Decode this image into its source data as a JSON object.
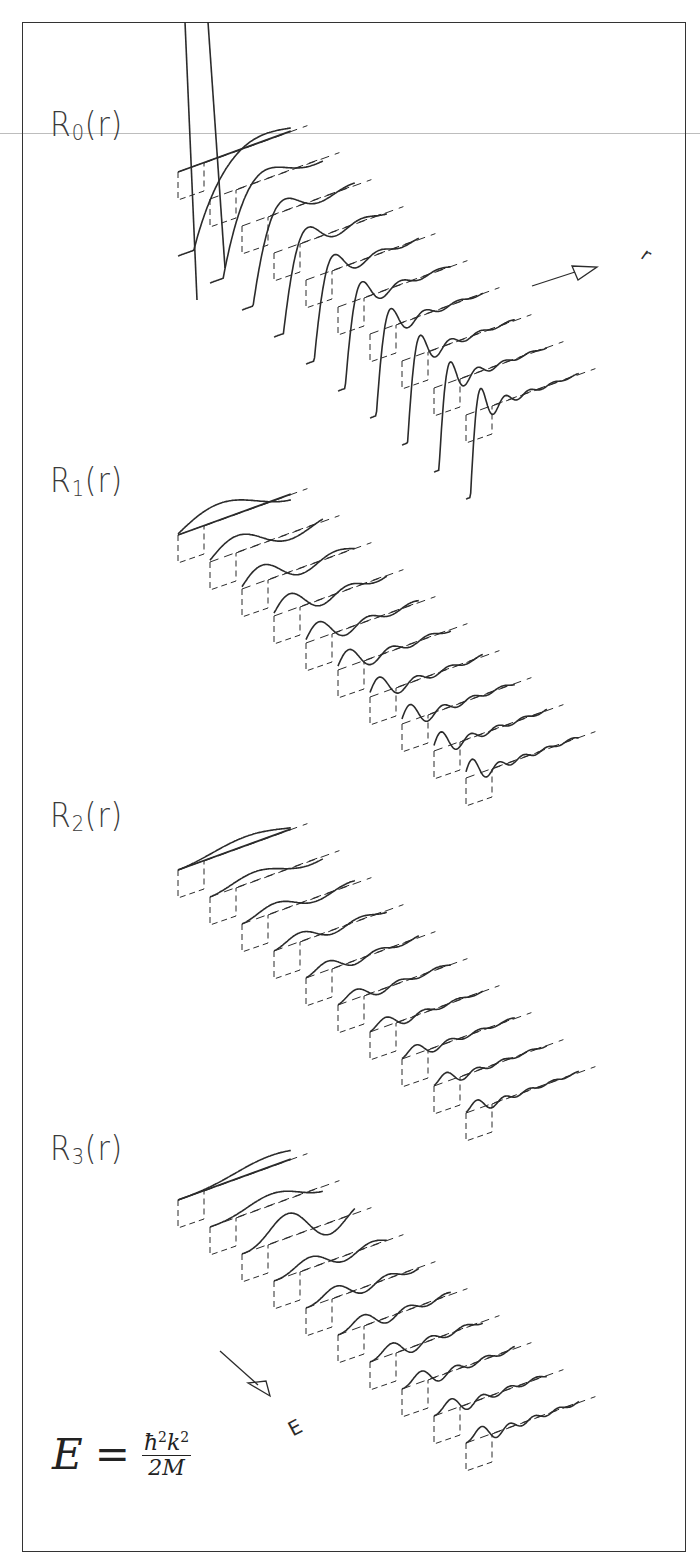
{
  "figure": {
    "panels": [
      {
        "label_main": "R",
        "label_sub": "0",
        "label_tail": "(r)"
      },
      {
        "label_main": "R",
        "label_sub": "1",
        "label_tail": "(r)"
      },
      {
        "label_main": "R",
        "label_sub": "2",
        "label_tail": "(r)"
      },
      {
        "label_main": "R",
        "label_sub": "3",
        "label_tail": "(r)"
      }
    ],
    "axis_labels": {
      "r_axis": "r",
      "energy_axis": "E"
    },
    "equation": {
      "lhs": "E",
      "equals": "=",
      "numerator_h": "ħ",
      "numerator_h_exp": "2",
      "numerator_k": "k",
      "numerator_k_exp": "2",
      "denominator": "2M"
    },
    "colors": {
      "line": "#2b2b2b",
      "frame": "#333333",
      "scanline": "#bdbdbd",
      "background": "#ffffff"
    }
  },
  "chart_data": [
    {
      "type": "line",
      "title": "R0(r)",
      "layout": "3D waterfall, 10 energy slices offset diagonally",
      "xlabel": "r",
      "zlabel": "E",
      "series_count": 10,
      "angular_momentum_l": 0,
      "origin": [
        178,
        172
      ],
      "slice_offset": [
        32,
        27
      ],
      "r_axis_length": 120,
      "amplitude": 150,
      "k_values": [
        0.6,
        0.9,
        1.2,
        1.5,
        1.8,
        2.1,
        2.4,
        2.7,
        3.0,
        3.3
      ],
      "notes": "Strong downward spike near small r, decaying oscillations with r"
    },
    {
      "type": "line",
      "title": "R1(r)",
      "layout": "3D waterfall, 10 energy slices offset diagonally",
      "xlabel": "r",
      "zlabel": "E",
      "series_count": 10,
      "angular_momentum_l": 1,
      "origin": [
        178,
        535
      ],
      "slice_offset": [
        32,
        27
      ],
      "r_axis_length": 120,
      "amplitude": 60,
      "k_values": [
        0.6,
        0.9,
        1.2,
        1.5,
        1.8,
        2.1,
        2.4,
        2.7,
        3.0,
        3.3
      ],
      "notes": "Sharp peak near small r followed by decaying oscillations"
    },
    {
      "type": "line",
      "title": "R2(r)",
      "layout": "3D waterfall, 10 energy slices offset diagonally",
      "xlabel": "r",
      "zlabel": "E",
      "series_count": 10,
      "angular_momentum_l": 2,
      "origin": [
        178,
        870
      ],
      "slice_offset": [
        32,
        27
      ],
      "r_axis_length": 120,
      "amplitude": 32,
      "k_values": [
        0.6,
        0.9,
        1.2,
        1.5,
        1.8,
        2.1,
        2.4,
        2.7,
        3.0,
        3.3
      ],
      "notes": "Smooth first peak, gently decaying oscillations"
    },
    {
      "type": "line",
      "title": "R3(r)",
      "layout": "3D waterfall, 10 energy slices offset diagonally",
      "xlabel": "r",
      "zlabel": "E",
      "series_count": 10,
      "angular_momentum_l": 3,
      "origin": [
        178,
        1200
      ],
      "slice_offset": [
        32,
        27
      ],
      "r_axis_length": 120,
      "amplitude": 40,
      "k_values": [
        0.6,
        0.9,
        1.2,
        1.5,
        1.8,
        2.1,
        2.4,
        2.7,
        3.0,
        3.3
      ],
      "notes": "Resonance peak at third slice, then decaying oscillations"
    }
  ]
}
